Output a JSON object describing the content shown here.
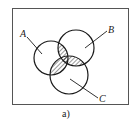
{
  "diagram": {
    "type": "venn",
    "caption": "a)",
    "sets": [
      {
        "id": "A",
        "label": "A"
      },
      {
        "id": "B",
        "label": "B"
      },
      {
        "id": "C",
        "label": "C"
      }
    ],
    "shaded_region": "(A∩B) ∪ (A∩C) ∪ (B∩C)",
    "colors": {
      "stroke": "#1a1a1a",
      "frame": "#555555",
      "hatch": "#333333",
      "background": "#ffffff"
    }
  }
}
